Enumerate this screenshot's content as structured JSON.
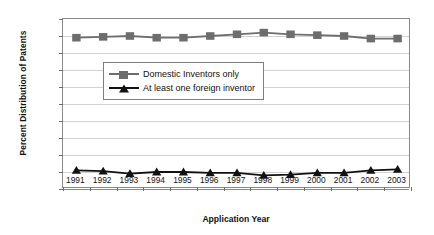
{
  "chart_data": {
    "type": "line",
    "title": "",
    "xlabel": "Application Year",
    "ylabel": "Percent Distribution of Patents",
    "categories": [
      "1991",
      "1992",
      "1993",
      "1994",
      "1995",
      "1996",
      "1997",
      "1998",
      "1999",
      "2000",
      "2001",
      "2002",
      "2003"
    ],
    "x": [
      1991,
      1992,
      1993,
      1994,
      1995,
      1996,
      1997,
      1998,
      1999,
      2000,
      2001,
      2002,
      2003
    ],
    "ylim": [
      0,
      100
    ],
    "yticks": [
      0,
      10,
      20,
      30,
      40,
      50,
      60,
      70,
      80,
      90,
      100
    ],
    "grid": true,
    "legend_position": "center",
    "series": [
      {
        "name": "Domestic Inventors only",
        "marker": "square",
        "color": "#6d6d6d",
        "values": [
          89,
          89.5,
          90,
          89,
          89,
          90,
          91,
          92,
          91,
          90.5,
          90,
          88.5,
          88.5
        ]
      },
      {
        "name": "At least one foreign inventor",
        "marker": "triangle",
        "color": "#111111",
        "values": [
          11,
          10.5,
          9,
          10,
          10,
          9.5,
          9.5,
          8,
          8.5,
          9.5,
          9.5,
          11,
          11.5
        ]
      }
    ]
  },
  "axes": {
    "ylabel": "Percent Distribution of Patents",
    "xlabel": "Application Year",
    "yticks": [
      "0",
      "10",
      "20",
      "30",
      "40",
      "50",
      "60",
      "70",
      "80",
      "90",
      "100"
    ],
    "xticks": [
      "1991",
      "1992",
      "1993",
      "1994",
      "1995",
      "1996",
      "1997",
      "1998",
      "1999",
      "2000",
      "2001",
      "2002",
      "2003"
    ]
  },
  "legend": {
    "items": [
      {
        "label": "Domestic Inventors only",
        "marker": "square-marker",
        "color": "#6d6d6d"
      },
      {
        "label": "At least one foreign inventor",
        "marker": "triangle-marker",
        "color": "#111111"
      }
    ]
  },
  "colors": {
    "series_domestic": "#6d6d6d",
    "series_foreign": "#111111",
    "gridline": "#d2d2d2",
    "axis": "#8a8a8a",
    "background": "#ffffff"
  }
}
